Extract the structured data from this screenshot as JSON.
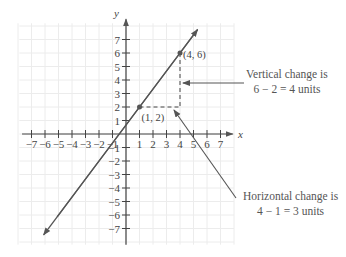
{
  "chart_data": {
    "type": "line",
    "title": "",
    "xlabel": "x",
    "ylabel": "y",
    "xlim": [
      -7.5,
      8
    ],
    "ylim": [
      -7.5,
      8
    ],
    "grid": true,
    "x_ticks": [
      -7,
      -6,
      -5,
      -4,
      -3,
      -2,
      -1,
      1,
      2,
      3,
      4,
      5,
      6,
      7
    ],
    "y_ticks": [
      -7,
      -6,
      -5,
      -4,
      -3,
      -2,
      -1,
      1,
      2,
      3,
      4,
      5,
      6,
      7
    ],
    "series": [
      {
        "name": "line through (1, 2) and (4, 6)",
        "slope": 1.3333,
        "intercept": 0.6667,
        "points": [
          {
            "x": 1,
            "y": 2,
            "label": "(1, 2)"
          },
          {
            "x": 4,
            "y": 6,
            "label": "(4, 6)"
          }
        ]
      }
    ],
    "annotations": [
      {
        "id": "vertical",
        "line1": "Vertical change is",
        "line2": "6 − 2 = 4 units"
      },
      {
        "id": "horizontal",
        "line1": "Horizontal change is",
        "line2": "4 − 1 = 3 units"
      }
    ]
  },
  "labels": {
    "x_axis": "x",
    "y_axis": "y",
    "point_a": "(1, 2)",
    "point_b": "(4, 6)",
    "vertical_line1": "Vertical change is",
    "vertical_line2": "6 − 2 = 4 units",
    "horizontal_line1": "Horizontal change is",
    "horizontal_line2": "4 − 1 = 3 units"
  },
  "colors": {
    "line": "#555555",
    "axis": "#444444",
    "grid": "#ececec",
    "dashed": "#444444"
  }
}
